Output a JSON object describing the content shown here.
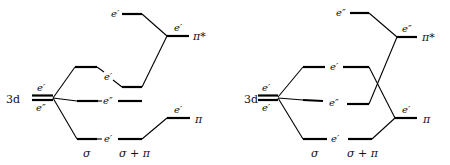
{
  "diagrams": [
    {
      "id": "left",
      "metal_label": "3d",
      "metal_upper_label": "e′",
      "metal_lower_label": "e″",
      "mo_labels": {
        "upper": "e′",
        "middle": "e″",
        "lower": "e′"
      },
      "ligand_labels": {
        "pi_star_level": "e′",
        "pi_star_top": "e′",
        "pi_level": "e′"
      },
      "ligand_orbitals": {
        "pi_star": "π*",
        "pi": "π"
      },
      "column_labels": {
        "sigma": "σ",
        "sigma_pi": "σ + π"
      }
    },
    {
      "id": "right",
      "metal_label": "3d",
      "metal_upper_label": "e′",
      "metal_lower_label": "e′",
      "mo_labels": {
        "upper": "e′",
        "middle": "e″",
        "lower": "e′"
      },
      "ligand_labels": {
        "pi_star_level": "e″",
        "pi_star_top": "e″",
        "pi_level": "e′"
      },
      "ligand_orbitals": {
        "pi_star": "π*",
        "pi": "π"
      },
      "column_labels": {
        "sigma": "σ",
        "sigma_pi": "σ + π"
      }
    }
  ]
}
